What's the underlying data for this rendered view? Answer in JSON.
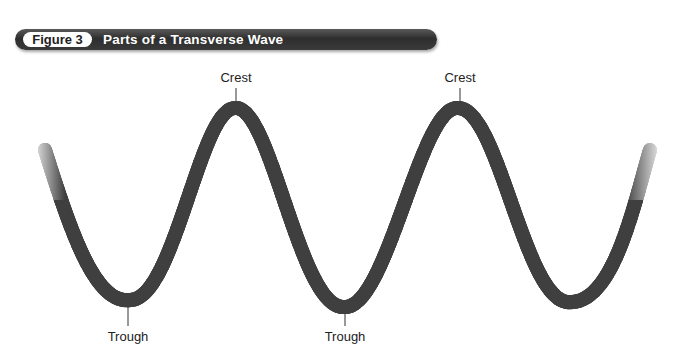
{
  "figure": {
    "number_label": "Figure 3",
    "title": "Parts of a Transverse Wave"
  },
  "labels": {
    "crests": [
      {
        "text": "Crest",
        "x": 236
      },
      {
        "text": "Crest",
        "x": 460
      }
    ],
    "troughs": [
      {
        "text": "Trough",
        "x": 128
      },
      {
        "text": "Trough",
        "x": 345
      }
    ]
  },
  "colors": {
    "title_bar": "#3a3a3a",
    "rope": "#6b6b6b",
    "rope_dark": "#3f3f3f",
    "rope_light": "#9a9a9a"
  }
}
